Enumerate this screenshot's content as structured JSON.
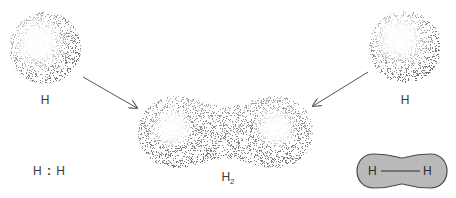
{
  "diagram": {
    "atoms": [
      {
        "id": "left-atom",
        "label": "H"
      },
      {
        "id": "right-atom",
        "label": "H"
      }
    ],
    "molecule": {
      "label_main": "H",
      "label_sub": "2"
    },
    "lewis_structure": {
      "left": "H",
      "separator": ":",
      "right": "H"
    },
    "structural_formula": {
      "left": "H",
      "right": "H",
      "bond": "single"
    },
    "colors": {
      "cloud_dark": "#6e6e6e",
      "cloud_light": "#ffffff",
      "capsule_fill": "#b9b9b9",
      "capsule_stroke": "#4a4a4a",
      "arrow": "#555555"
    }
  }
}
